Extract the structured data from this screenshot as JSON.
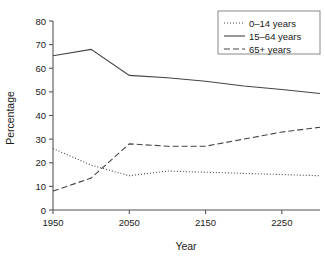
{
  "chart_data": {
    "type": "line",
    "title": "",
    "xlabel": "Year",
    "ylabel": "Percentage",
    "xlim": [
      1950,
      2300
    ],
    "ylim": [
      0,
      80
    ],
    "xticks": [
      1950,
      2050,
      2150,
      2250
    ],
    "yticks": [
      0,
      10,
      20,
      30,
      40,
      50,
      60,
      70,
      80
    ],
    "grid": false,
    "legend_position": "top-right",
    "x": [
      1950,
      2000,
      2050,
      2100,
      2150,
      2200,
      2250,
      2300
    ],
    "series": [
      {
        "name": "0–14 years",
        "style": "dotted",
        "color": "#444444",
        "values": [
          26.0,
          19.0,
          14.5,
          16.5,
          16.0,
          15.5,
          15.0,
          14.5
        ]
      },
      {
        "name": "15–64 years",
        "style": "solid",
        "color": "#444444",
        "values": [
          65.3,
          68.0,
          57.0,
          56.0,
          54.5,
          52.5,
          51.0,
          49.3
        ]
      },
      {
        "name": "65+ years",
        "style": "dashed",
        "color": "#444444",
        "values": [
          8.0,
          13.5,
          28.0,
          27.0,
          27.0,
          30.0,
          33.0,
          35.0
        ]
      }
    ]
  },
  "axis": {
    "ylabel": "Percentage",
    "xlabel": "Year",
    "xtick_labels": [
      "1950",
      "2050",
      "2150",
      "2250"
    ],
    "ytick_labels": [
      "0",
      "10",
      "20",
      "30",
      "40",
      "50",
      "60",
      "70",
      "80"
    ]
  },
  "legend": {
    "items": [
      {
        "label": "0–14 years",
        "style": "dotted"
      },
      {
        "label": "15–64 years",
        "style": "solid"
      },
      {
        "label": "65+ years",
        "style": "dashed"
      }
    ]
  }
}
